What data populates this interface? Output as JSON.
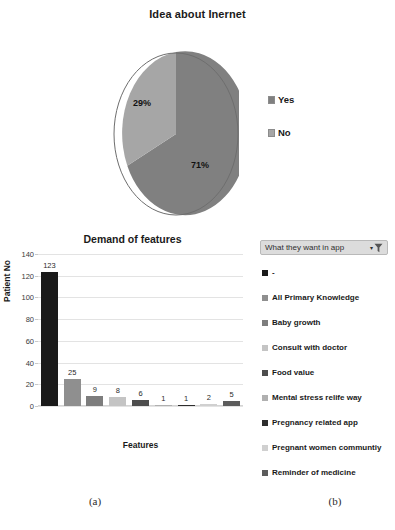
{
  "pie_panel": {
    "title": "Idea about Inernet",
    "labels": {
      "slice1": "29%",
      "slice2": "71%"
    },
    "legend": [
      {
        "label": "Yes",
        "color": "#808080"
      },
      {
        "label": "No",
        "color": "#a6a6a6"
      }
    ]
  },
  "bar_panel": {
    "title": "Demand of features",
    "xlabel": "Features",
    "ylabel": "Patient  No"
  },
  "filter": {
    "label": "What they want in app",
    "caret": "▾",
    "icon": "filter-funnel-icon"
  },
  "category_legend": [
    {
      "label": "-",
      "color": "#1a1a1a"
    },
    {
      "label": "All Primary Knowledge",
      "color": "#8f8f8f"
    },
    {
      "label": "Baby growth",
      "color": "#7d7d7d"
    },
    {
      "label": "Consult with doctor",
      "color": "#c4c4c4"
    },
    {
      "label": "Food value",
      "color": "#4d4d4d"
    },
    {
      "label": "Mental stress relife way",
      "color": "#b0b0b0"
    },
    {
      "label": "Pregnancy related app",
      "color": "#2e2e2e"
    },
    {
      "label": "Pregnant women communtiy",
      "color": "#d0d0d0"
    },
    {
      "label": "Reminder of medicine",
      "color": "#5c5c5c"
    }
  ],
  "captions": {
    "a": "(a)",
    "b": "(b)"
  },
  "chart_data": [
    {
      "type": "pie",
      "title": "Idea about Inernet",
      "categories": [
        "Yes",
        "No"
      ],
      "values": [
        71,
        29
      ],
      "value_labels": [
        "71%",
        "29%"
      ],
      "colors": [
        "#808080",
        "#a6a6a6"
      ],
      "legend_position": "right",
      "units": "percent"
    },
    {
      "type": "bar",
      "title": "Demand of features",
      "xlabel": "Features",
      "ylabel": "Patient  No",
      "ylim": [
        0,
        140
      ],
      "yticks": [
        0,
        20,
        40,
        60,
        80,
        100,
        120,
        140
      ],
      "grid": true,
      "legend_position": "right",
      "categories": [
        "-",
        "All Primary Knowledge",
        "Baby growth",
        "Consult with doctor",
        "Food value",
        "Mental stress relife way",
        "Pregnancy related app",
        "Pregnant women communtiy",
        "Reminder of medicine"
      ],
      "values": [
        123,
        25,
        9,
        8,
        6,
        1,
        1,
        2,
        5
      ],
      "data_labels": [
        "123",
        "25",
        "9",
        "8",
        "6",
        "1",
        "1",
        "2",
        "5"
      ],
      "colors": [
        "#1a1a1a",
        "#8f8f8f",
        "#7d7d7d",
        "#c4c4c4",
        "#4d4d4d",
        "#b0b0b0",
        "#2e2e2e",
        "#d0d0d0",
        "#5c5c5c"
      ]
    }
  ]
}
